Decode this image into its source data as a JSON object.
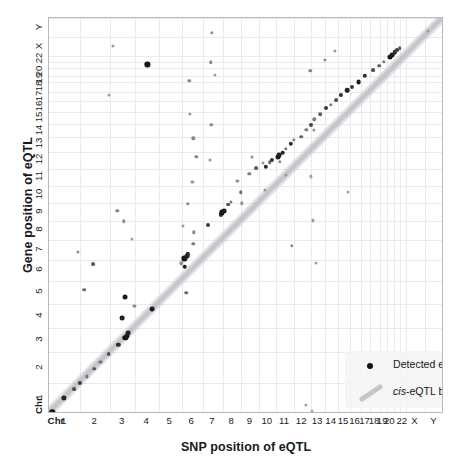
{
  "figure": {
    "title": "",
    "background": "#ffffff",
    "frame_color": "#b9b9bc",
    "grid_color": "#e9e9ef"
  },
  "axes": {
    "x_title": "SNP position of eQTL",
    "y_title": "Gene position of eQTL",
    "chr_prefix": "Chr"
  },
  "legend": {
    "point_label": "Detected eQTL",
    "band_label_italic": "cis",
    "band_label_rest": "-eQTL band",
    "point_color": "#111111",
    "band_color": "#c9c9cf"
  },
  "chart_data": {
    "type": "scatter",
    "title": "",
    "xlabel": "SNP position of eQTL",
    "ylabel": "Gene position of eQTL",
    "grid": true,
    "legend_position": "bottom-right",
    "xlim": [
      0,
      1
    ],
    "ylim": [
      0,
      1
    ],
    "axis_units": "cumulative genome position (normalized 0-1)",
    "tick_labels": [
      "1",
      "2",
      "3",
      "4",
      "5",
      "6",
      "7",
      "8",
      "9",
      "10",
      "11",
      "12",
      "13",
      "14",
      "15",
      "16",
      "17",
      "18",
      "19",
      "20",
      "22",
      "X",
      "Y"
    ],
    "chromosome_boundaries": [
      0.0,
      0.0787,
      0.1554,
      0.2181,
      0.2784,
      0.3356,
      0.3897,
      0.44,
      0.4873,
      0.5322,
      0.5757,
      0.6193,
      0.6625,
      0.6996,
      0.7317,
      0.7623,
      0.7894,
      0.8138,
      0.8373,
      0.8546,
      0.8736,
      0.8879,
      0.9034,
      0.952,
      1.0
    ],
    "tick_centers": [
      0.0394,
      0.1171,
      0.1868,
      0.2483,
      0.307,
      0.3627,
      0.4149,
      0.4637,
      0.5098,
      0.554,
      0.5975,
      0.6409,
      0.6811,
      0.7157,
      0.747,
      0.7759,
      0.8016,
      0.8256,
      0.846,
      0.8641,
      0.8957,
      0.9277,
      0.976
    ],
    "series": [
      {
        "name": "cis-eQTL band",
        "type": "band",
        "description": "diagonal identity band where SNP position equals gene position",
        "color": "#c9c9cf",
        "width_normalized": 0.016
      },
      {
        "name": "Detected eQTL",
        "type": "scatter",
        "color": "#111111",
        "points": [
          {
            "x": 0.008,
            "y": 0.006,
            "r": 2.7,
            "c": "#171717"
          },
          {
            "x": 0.037,
            "y": 0.04,
            "r": 2.6,
            "c": "#222222"
          },
          {
            "x": 0.063,
            "y": 0.063,
            "r": 1.9,
            "c": "#4e4e4e"
          },
          {
            "x": 0.078,
            "y": 0.079,
            "r": 2.1,
            "c": "#3a3a3a"
          },
          {
            "x": 0.095,
            "y": 0.095,
            "r": 1.6,
            "c": "#707070"
          },
          {
            "x": 0.114,
            "y": 0.114,
            "r": 1.8,
            "c": "#5a5a5a"
          },
          {
            "x": 0.13,
            "y": 0.131,
            "r": 1.6,
            "c": "#6d6d6d"
          },
          {
            "x": 0.151,
            "y": 0.151,
            "r": 1.9,
            "c": "#4a4a4a"
          },
          {
            "x": 0.175,
            "y": 0.175,
            "r": 2.2,
            "c": "#2e2e2e"
          },
          {
            "x": 0.193,
            "y": 0.193,
            "r": 2.7,
            "c": "#141414"
          },
          {
            "x": 0.197,
            "y": 0.197,
            "r": 2.6,
            "c": "#181818"
          },
          {
            "x": 0.201,
            "y": 0.205,
            "r": 2.4,
            "c": "#232323"
          },
          {
            "x": 0.186,
            "y": 0.243,
            "r": 2.4,
            "c": "#1f1f1f"
          },
          {
            "x": 0.216,
            "y": 0.274,
            "r": 1.6,
            "c": "#8c8c8c"
          },
          {
            "x": 0.262,
            "y": 0.265,
            "r": 2.4,
            "c": "#1e1e1e"
          },
          {
            "x": 0.193,
            "y": 0.295,
            "r": 2.5,
            "c": "#1a1a1a"
          },
          {
            "x": 0.089,
            "y": 0.314,
            "r": 1.8,
            "c": "#6a6a6a"
          },
          {
            "x": 0.111,
            "y": 0.378,
            "r": 1.9,
            "c": "#5c5c5c"
          },
          {
            "x": 0.074,
            "y": 0.41,
            "r": 1.6,
            "c": "#8e8e8e"
          },
          {
            "x": 0.335,
            "y": 0.381,
            "r": 1.7,
            "c": "#8f8f8f"
          },
          {
            "x": 0.343,
            "y": 0.393,
            "r": 2.6,
            "c": "#161616"
          },
          {
            "x": 0.349,
            "y": 0.399,
            "r": 2.4,
            "c": "#222222"
          },
          {
            "x": 0.352,
            "y": 0.403,
            "r": 2.2,
            "c": "#2a2a2a"
          },
          {
            "x": 0.344,
            "y": 0.372,
            "r": 2.3,
            "c": "#1c1c1c"
          },
          {
            "x": 0.365,
            "y": 0.43,
            "r": 1.7,
            "c": "#7b7b7b"
          },
          {
            "x": 0.173,
            "y": 0.513,
            "r": 1.7,
            "c": "#858585"
          },
          {
            "x": 0.338,
            "y": 0.474,
            "r": 1.6,
            "c": "#9a9a9a"
          },
          {
            "x": 0.402,
            "y": 0.477,
            "r": 2.0,
            "c": "#3f3f3f"
          },
          {
            "x": 0.435,
            "y": 0.504,
            "r": 2.1,
            "c": "#343434"
          },
          {
            "x": 0.437,
            "y": 0.509,
            "r": 2.6,
            "c": "#151515"
          },
          {
            "x": 0.443,
            "y": 0.513,
            "r": 2.4,
            "c": "#1e1e1e"
          },
          {
            "x": 0.454,
            "y": 0.529,
            "r": 1.9,
            "c": "#505050"
          },
          {
            "x": 0.46,
            "y": 0.536,
            "r": 1.6,
            "c": "#777777"
          },
          {
            "x": 0.485,
            "y": 0.56,
            "r": 1.7,
            "c": "#6f6f6f"
          },
          {
            "x": 0.546,
            "y": 0.566,
            "r": 1.6,
            "c": "#969696"
          },
          {
            "x": 0.477,
            "y": 0.588,
            "r": 1.6,
            "c": "#929292"
          },
          {
            "x": 0.507,
            "y": 0.607,
            "r": 1.7,
            "c": "#7c7c7c"
          },
          {
            "x": 0.524,
            "y": 0.621,
            "r": 1.9,
            "c": "#5e5e5e"
          },
          {
            "x": 0.549,
            "y": 0.625,
            "r": 2.2,
            "c": "#2b2b2b"
          },
          {
            "x": 0.559,
            "y": 0.636,
            "r": 1.8,
            "c": "#6a6a6a"
          },
          {
            "x": 0.565,
            "y": 0.642,
            "r": 2.1,
            "c": "#333333"
          },
          {
            "x": 0.579,
            "y": 0.648,
            "r": 2.5,
            "c": "#1a1a1a"
          },
          {
            "x": 0.583,
            "y": 0.653,
            "r": 2.4,
            "c": "#1f1f1f"
          },
          {
            "x": 0.592,
            "y": 0.66,
            "r": 2.3,
            "c": "#262626"
          },
          {
            "x": 0.6,
            "y": 0.669,
            "r": 1.7,
            "c": "#7a7a7a"
          },
          {
            "x": 0.612,
            "y": 0.683,
            "r": 2.2,
            "c": "#2d2d2d"
          },
          {
            "x": 0.62,
            "y": 0.692,
            "r": 1.7,
            "c": "#808080"
          },
          {
            "x": 0.373,
            "y": 0.65,
            "r": 1.7,
            "c": "#8a8a8a"
          },
          {
            "x": 0.513,
            "y": 0.649,
            "r": 1.6,
            "c": "#939393"
          },
          {
            "x": 0.584,
            "y": 0.637,
            "r": 1.7,
            "c": "#878787"
          },
          {
            "x": 0.639,
            "y": 0.7,
            "r": 1.8,
            "c": "#666666"
          },
          {
            "x": 0.651,
            "y": 0.718,
            "r": 1.7,
            "c": "#7e7e7e"
          },
          {
            "x": 0.663,
            "y": 0.729,
            "r": 2.0,
            "c": "#444444"
          },
          {
            "x": 0.672,
            "y": 0.744,
            "r": 1.7,
            "c": "#7d7d7d"
          },
          {
            "x": 0.686,
            "y": 0.757,
            "r": 1.8,
            "c": "#636363"
          },
          {
            "x": 0.701,
            "y": 0.772,
            "r": 2.0,
            "c": "#3c3c3c"
          },
          {
            "x": 0.713,
            "y": 0.781,
            "r": 1.7,
            "c": "#787878"
          },
          {
            "x": 0.726,
            "y": 0.793,
            "r": 1.9,
            "c": "#545454"
          },
          {
            "x": 0.74,
            "y": 0.805,
            "r": 2.1,
            "c": "#303030"
          },
          {
            "x": 0.755,
            "y": 0.817,
            "r": 2.3,
            "c": "#232323"
          },
          {
            "x": 0.766,
            "y": 0.826,
            "r": 2.0,
            "c": "#3b3b3b"
          },
          {
            "x": 0.784,
            "y": 0.839,
            "r": 2.4,
            "c": "#1b1b1b"
          },
          {
            "x": 0.8,
            "y": 0.854,
            "r": 2.2,
            "c": "#2a2a2a"
          },
          {
            "x": 0.82,
            "y": 0.868,
            "r": 1.9,
            "c": "#4f4f4f"
          },
          {
            "x": 0.836,
            "y": 0.88,
            "r": 1.8,
            "c": "#606060"
          },
          {
            "x": 0.848,
            "y": 0.89,
            "r": 1.7,
            "c": "#7a7a7a"
          },
          {
            "x": 0.863,
            "y": 0.902,
            "r": 2.5,
            "c": "#181818"
          },
          {
            "x": 0.869,
            "y": 0.907,
            "r": 2.4,
            "c": "#1d1d1d"
          },
          {
            "x": 0.875,
            "y": 0.913,
            "r": 2.2,
            "c": "#2c2c2c"
          },
          {
            "x": 0.882,
            "y": 0.918,
            "r": 2.0,
            "c": "#3a3a3a"
          },
          {
            "x": 0.888,
            "y": 0.923,
            "r": 1.8,
            "c": "#575757"
          },
          {
            "x": 0.662,
            "y": 0.866,
            "r": 1.7,
            "c": "#838383"
          },
          {
            "x": 0.699,
            "y": 0.894,
            "r": 1.6,
            "c": "#919191"
          },
          {
            "x": 0.724,
            "y": 0.916,
            "r": 1.6,
            "c": "#9b9b9b"
          },
          {
            "x": 0.151,
            "y": 0.805,
            "r": 1.6,
            "c": "#9e9e9e"
          },
          {
            "x": 0.249,
            "y": 0.883,
            "r": 2.6,
            "c": "#151515"
          },
          {
            "x": 0.41,
            "y": 0.888,
            "r": 1.7,
            "c": "#8b8b8b"
          },
          {
            "x": 0.42,
            "y": 0.856,
            "r": 1.6,
            "c": "#9d9d9d"
          },
          {
            "x": 0.161,
            "y": 0.929,
            "r": 1.6,
            "c": "#a0a0a0"
          },
          {
            "x": 0.412,
            "y": 0.963,
            "r": 1.7,
            "c": "#8d8d8d"
          },
          {
            "x": 0.411,
            "y": 0.731,
            "r": 1.7,
            "c": "#8c8c8c"
          },
          {
            "x": 0.407,
            "y": 0.642,
            "r": 1.6,
            "c": "#979797"
          },
          {
            "x": 0.542,
            "y": 0.635,
            "r": 1.6,
            "c": "#9c9c9c"
          },
          {
            "x": 0.6,
            "y": 0.603,
            "r": 1.6,
            "c": "#9a9a9a"
          },
          {
            "x": 0.67,
            "y": 0.718,
            "r": 1.6,
            "c": "#969696"
          },
          {
            "x": 0.664,
            "y": 0.6,
            "r": 1.6,
            "c": "#a2a2a2"
          },
          {
            "x": 0.668,
            "y": 0.489,
            "r": 1.6,
            "c": "#9f9f9f"
          },
          {
            "x": 0.614,
            "y": 0.425,
            "r": 1.7,
            "c": "#8a8a8a"
          },
          {
            "x": 0.757,
            "y": 0.56,
            "r": 1.6,
            "c": "#a1a1a1"
          },
          {
            "x": 0.675,
            "y": 0.381,
            "r": 1.6,
            "c": "#a4a4a4"
          },
          {
            "x": 0.65,
            "y": 0.024,
            "r": 1.6,
            "c": "#a3a3a3"
          },
          {
            "x": 0.665,
            "y": 0.008,
            "r": 1.6,
            "c": "#a8a8a8"
          },
          {
            "x": 0.21,
            "y": 0.442,
            "r": 1.6,
            "c": "#a0a0a0"
          },
          {
            "x": 0.189,
            "y": 0.487,
            "r": 1.7,
            "c": "#8e8e8e"
          },
          {
            "x": 0.348,
            "y": 0.306,
            "r": 1.8,
            "c": "#696969"
          },
          {
            "x": 0.366,
            "y": 0.459,
            "r": 1.7,
            "c": "#858585"
          },
          {
            "x": 0.352,
            "y": 0.531,
            "r": 1.7,
            "c": "#888888"
          },
          {
            "x": 0.488,
            "y": 0.532,
            "r": 1.7,
            "c": "#8f8f8f"
          },
          {
            "x": 0.363,
            "y": 0.587,
            "r": 1.6,
            "c": "#989898"
          },
          {
            "x": 0.365,
            "y": 0.696,
            "r": 1.7,
            "c": "#868686"
          },
          {
            "x": 0.357,
            "y": 0.758,
            "r": 1.6,
            "c": "#949494"
          },
          {
            "x": 0.355,
            "y": 0.842,
            "r": 1.7,
            "c": "#8b8b8b"
          },
          {
            "x": 0.959,
            "y": 0.967,
            "r": 1.6,
            "c": "#9a9a9a"
          }
        ]
      }
    ]
  }
}
